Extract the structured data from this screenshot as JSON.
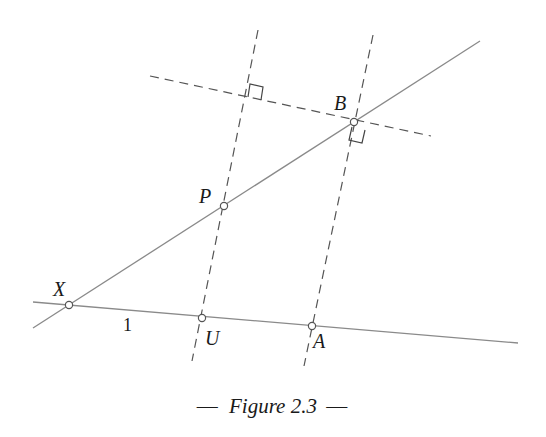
{
  "figure": {
    "caption_prefix": "—",
    "caption_text": "Figure 2.3",
    "caption_suffix": "—",
    "caption_position": [
      272,
      413
    ]
  },
  "colors": {
    "solid_line": "#8a8a8a",
    "dashed_line": "#555555",
    "text": "#1a1a1a",
    "background": "#ffffff"
  },
  "points": [
    {
      "id": "X",
      "label": "X",
      "x": 69,
      "y": 305,
      "label_x": 53,
      "label_y": 296,
      "style": "italic"
    },
    {
      "id": "U",
      "label": "U",
      "x": 202,
      "y": 318,
      "label_x": 205,
      "label_y": 345,
      "style": "italic"
    },
    {
      "id": "A",
      "label": "A",
      "x": 312,
      "y": 326,
      "label_x": 313,
      "label_y": 348,
      "style": "italic"
    },
    {
      "id": "P",
      "label": "P",
      "x": 224,
      "y": 206,
      "label_x": 199,
      "label_y": 203,
      "style": "italic"
    },
    {
      "id": "B",
      "label": "B",
      "x": 354,
      "y": 122,
      "label_x": 334,
      "label_y": 110,
      "style": "italic"
    }
  ],
  "segment_labels": [
    {
      "id": "XU-length",
      "text": "1",
      "x": 123,
      "y": 331
    }
  ],
  "solid_lines": [
    {
      "id": "line-XA",
      "x1": 33,
      "y1": 302,
      "x2": 518,
      "y2": 343
    },
    {
      "id": "line-XB",
      "x1": 33,
      "y1": 328,
      "x2": 480,
      "y2": 41
    }
  ],
  "dashed_lines": [
    {
      "id": "line-UP",
      "x1": 258,
      "y1": 30,
      "x2": 192,
      "y2": 361
    },
    {
      "id": "line-AB",
      "x1": 373,
      "y1": 35,
      "x2": 304,
      "y2": 366
    },
    {
      "id": "perpendicular-B",
      "x1": 150,
      "y1": 76,
      "x2": 431,
      "y2": 136
    }
  ],
  "right_angles": [
    {
      "id": "right-angle-top",
      "path": "M 248 97 L 250 84 L 263 87 L 261 100"
    },
    {
      "id": "right-angle-B",
      "path": "M 352 127 L 349 140 L 362 143 L 365 130"
    }
  ]
}
